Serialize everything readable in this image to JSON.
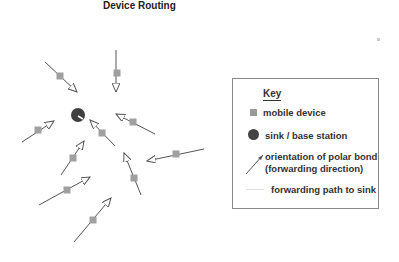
{
  "title": "Device Routing",
  "colors": {
    "mobile_device": "#a0a0a0",
    "sink": "#3f3f3f",
    "arrow": "#555555",
    "path": "#dddddd"
  },
  "legend": {
    "heading": "Key",
    "items": [
      {
        "icon": "square-icon",
        "label": "mobile device"
      },
      {
        "icon": "circle-icon",
        "label": "sink / base station"
      },
      {
        "icon": "arrow-icon",
        "label_line1": "orientation of polar bond",
        "label_line2": "(forwarding direction)"
      },
      {
        "icon": "line-icon",
        "label": "forwarding path to sink"
      }
    ]
  },
  "sink": {
    "x": 78,
    "y": 115,
    "r": 7
  },
  "devices": [
    {
      "sx": 60,
      "sy": 76,
      "x1": 45,
      "y1": 62,
      "x2": 77,
      "y2": 92
    },
    {
      "sx": 117,
      "sy": 73,
      "x1": 116,
      "y1": 50,
      "x2": 116,
      "y2": 92
    },
    {
      "sx": 133,
      "sy": 122,
      "x1": 155,
      "y1": 134,
      "x2": 116,
      "y2": 114
    },
    {
      "sx": 38,
      "sy": 130,
      "x1": 22,
      "y1": 142,
      "x2": 54,
      "y2": 121
    },
    {
      "sx": 102,
      "sy": 133,
      "x1": 115,
      "y1": 146,
      "x2": 90,
      "y2": 120
    },
    {
      "sx": 73,
      "sy": 158,
      "x1": 61,
      "y1": 175,
      "x2": 84,
      "y2": 141
    },
    {
      "sx": 176,
      "sy": 154,
      "x1": 204,
      "y1": 149,
      "x2": 147,
      "y2": 161
    },
    {
      "sx": 134,
      "sy": 178,
      "x1": 141,
      "y1": 195,
      "x2": 124,
      "y2": 153
    },
    {
      "sx": 67,
      "sy": 190,
      "x1": 39,
      "y1": 205,
      "x2": 90,
      "y2": 177
    },
    {
      "sx": 93,
      "sy": 220,
      "x1": 74,
      "y1": 242,
      "x2": 111,
      "y2": 198
    }
  ],
  "stray_device": {
    "x": 379,
    "y": 40
  }
}
